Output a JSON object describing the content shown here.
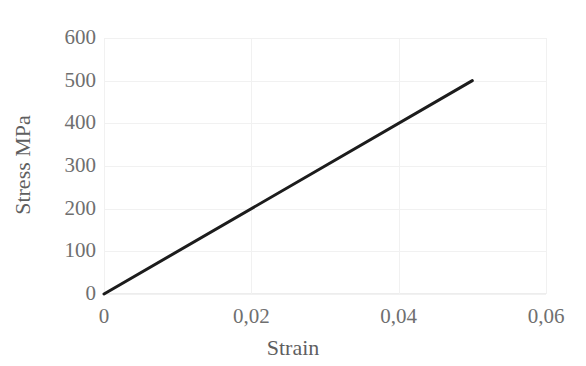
{
  "chart_data": {
    "type": "line",
    "title": "",
    "xlabel": "Strain",
    "ylabel": "Stress MPa",
    "xlim": [
      0,
      0.06
    ],
    "ylim": [
      0,
      600
    ],
    "grid": true,
    "legend": "none",
    "decimal_separator": ",",
    "x_tick_labels": [
      "0",
      "0,02",
      "0,04",
      "0,06"
    ],
    "x_tick_values": [
      0,
      0.02,
      0.04,
      0.06
    ],
    "y_tick_labels": [
      "0",
      "100",
      "200",
      "300",
      "400",
      "500",
      "600"
    ],
    "y_tick_values": [
      0,
      100,
      200,
      300,
      400,
      500,
      600
    ],
    "series": [
      {
        "name": "Stress-Strain",
        "color": "#1c1c1c",
        "line_width": 3,
        "x": [
          0,
          0.05
        ],
        "values": [
          0,
          500
        ],
        "points": [
          {
            "x": 0,
            "y": 0
          },
          {
            "x": 0.01,
            "y": 100
          },
          {
            "x": 0.02,
            "y": 200
          },
          {
            "x": 0.03,
            "y": 300
          },
          {
            "x": 0.04,
            "y": 400
          },
          {
            "x": 0.05,
            "y": 500
          }
        ]
      }
    ],
    "annotations": [],
    "colors": {
      "series_line": "#1c1c1c",
      "grid": "#f1f1f1",
      "tick_text": "#6f6f6f",
      "axis_title_text": "#5f5f5f",
      "background": "#ffffff"
    }
  }
}
